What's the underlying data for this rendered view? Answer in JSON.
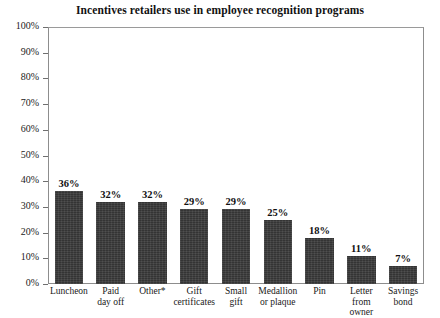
{
  "chart_data": {
    "type": "bar",
    "title": "Incentives retailers use in employee recognition programs",
    "xlabel": "",
    "ylabel": "",
    "ylim": [
      0,
      100
    ],
    "y_unit": "%",
    "grid": false,
    "legend": "none",
    "yticks": [
      "0%",
      "10%",
      "20%",
      "30%",
      "40%",
      "50%",
      "60%",
      "70%",
      "80%",
      "90%",
      "100%"
    ],
    "ytick_values": [
      0,
      10,
      20,
      30,
      40,
      50,
      60,
      70,
      80,
      90,
      100
    ],
    "categories": [
      "Luncheon",
      "Paid day off",
      "Other*",
      "Gift certificates",
      "Small gift",
      "Medallion or plaque",
      "Pin",
      "Letter from owner",
      "Savings bond"
    ],
    "category_lines": [
      [
        "Luncheon"
      ],
      [
        "Paid",
        "day off"
      ],
      [
        "Other*"
      ],
      [
        "Gift",
        "certificates"
      ],
      [
        "Small",
        "gift"
      ],
      [
        "Medallion",
        "or plaque"
      ],
      [
        "Pin"
      ],
      [
        "Letter",
        "from owner"
      ],
      [
        "Savings",
        "bond"
      ]
    ],
    "values": [
      36,
      32,
      32,
      29,
      29,
      25,
      18,
      11,
      7
    ],
    "value_labels": [
      "36%",
      "32%",
      "32%",
      "29%",
      "29%",
      "25%",
      "18%",
      "11%",
      "7%"
    ],
    "bar_color": "#3b3b3b",
    "frame_color": "#8d8d8d",
    "background": "#ffffff",
    "text_color": "#111111"
  }
}
